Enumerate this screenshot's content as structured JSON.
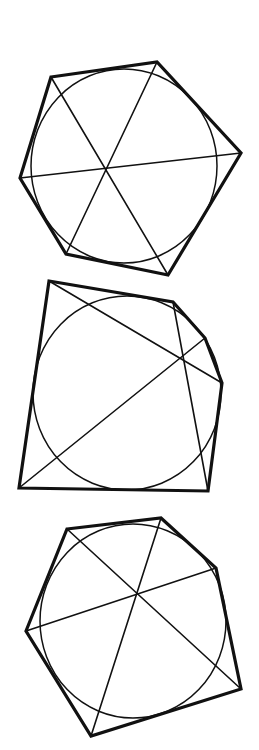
{
  "canvas": {
    "width": 259,
    "height": 750,
    "background": "#ffffff"
  },
  "style": {
    "stroke_color": "#111111",
    "outline_width": 3.2,
    "circle_width": 1.5,
    "diagonal_width": 1.6
  },
  "figures": [
    {
      "name": "figure-1-hexagon",
      "polygon": [
        [
          51,
          77
        ],
        [
          157,
          62
        ],
        [
          241,
          153
        ],
        [
          168,
          275
        ],
        [
          66,
          254
        ],
        [
          20,
          178
        ]
      ],
      "circle": {
        "cx": 124,
        "cy": 166,
        "rx": 93,
        "ry": 97
      },
      "diagonals": [
        [
          [
            51,
            77
          ],
          [
            168,
            275
          ]
        ],
        [
          [
            157,
            62
          ],
          [
            66,
            254
          ]
        ],
        [
          [
            241,
            153
          ],
          [
            20,
            178
          ]
        ]
      ]
    },
    {
      "name": "figure-2-irregular",
      "polygon": [
        [
          49,
          281
        ],
        [
          173,
          302
        ],
        [
          205,
          338
        ],
        [
          222,
          383
        ],
        [
          208,
          491
        ],
        [
          19,
          488
        ]
      ],
      "circle": {
        "cx": 127,
        "cy": 393,
        "rx": 94,
        "ry": 97
      },
      "diagonals": [
        [
          [
            49,
            281
          ],
          [
            222,
            383
          ]
        ],
        [
          [
            205,
            338
          ],
          [
            19,
            488
          ]
        ],
        [
          [
            173,
            302
          ],
          [
            208,
            491
          ]
        ]
      ]
    },
    {
      "name": "figure-3-hexagon",
      "polygon": [
        [
          67,
          529
        ],
        [
          161,
          518
        ],
        [
          216,
          568
        ],
        [
          241,
          689
        ],
        [
          91,
          736
        ],
        [
          26,
          631
        ]
      ],
      "circle": {
        "cx": 133,
        "cy": 621,
        "rx": 93,
        "ry": 97
      },
      "diagonals": [
        [
          [
            67,
            529
          ],
          [
            241,
            689
          ]
        ],
        [
          [
            161,
            518
          ],
          [
            91,
            736
          ]
        ],
        [
          [
            216,
            568
          ],
          [
            26,
            631
          ]
        ]
      ]
    }
  ]
}
